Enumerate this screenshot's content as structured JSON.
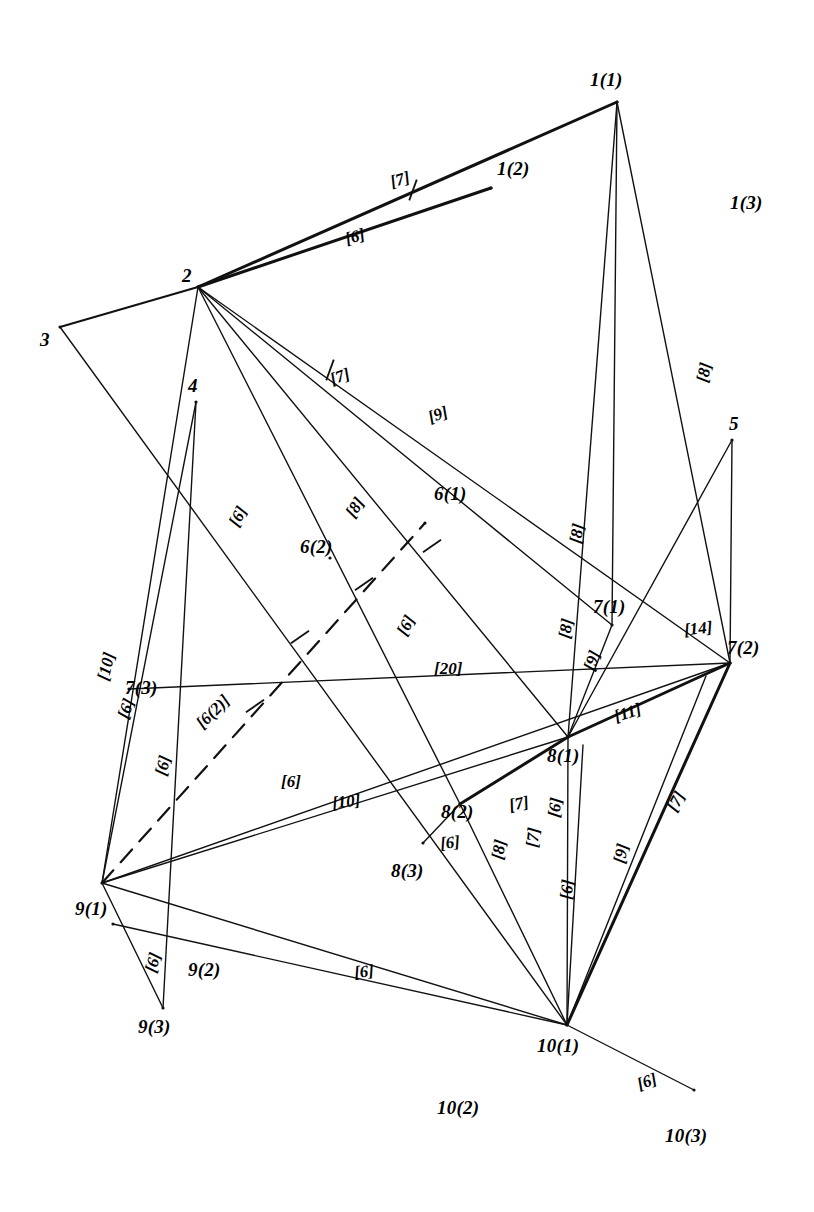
{
  "figure": {
    "type": "node-link-network-diagram",
    "background_color": "#ffffff",
    "line_color": "#111111"
  },
  "nodes": [
    {
      "id": "1(1)",
      "label": "1(1)",
      "x": 617,
      "y": 102,
      "label_x": 590,
      "label_y": 70,
      "has_vertex": true
    },
    {
      "id": "1(2)",
      "label": "1(2)",
      "x": 491,
      "y": 188,
      "label_x": 497,
      "label_y": 159,
      "has_vertex": true
    },
    {
      "id": "1(3)",
      "label": "1(3)",
      "x": 748,
      "y": 205,
      "label_x": 730,
      "label_y": 193,
      "has_vertex": false
    },
    {
      "id": "2",
      "label": "2",
      "x": 198,
      "y": 287,
      "label_x": 182,
      "label_y": 266,
      "has_vertex": true
    },
    {
      "id": "3",
      "label": "3",
      "x": 60,
      "y": 327,
      "label_x": 40,
      "label_y": 330,
      "has_vertex": true
    },
    {
      "id": "4",
      "label": "4",
      "x": 196,
      "y": 402,
      "label_x": 188,
      "label_y": 376,
      "has_vertex": true
    },
    {
      "id": "5",
      "label": "5",
      "x": 732,
      "y": 440,
      "label_x": 729,
      "label_y": 414,
      "has_vertex": true
    },
    {
      "id": "6(1)",
      "label": "6(1)",
      "x": 425,
      "y": 523,
      "label_x": 434,
      "label_y": 484,
      "has_vertex": true
    },
    {
      "id": "6(2)",
      "label": "6(2)",
      "x": 330,
      "y": 558,
      "label_x": 300,
      "label_y": 537,
      "has_vertex": true
    },
    {
      "id": "7(1)",
      "label": "7(1)",
      "x": 612,
      "y": 625,
      "label_x": 593,
      "label_y": 597,
      "has_vertex": true
    },
    {
      "id": "7(2)",
      "label": "7(2)",
      "x": 730,
      "y": 663,
      "label_x": 727,
      "label_y": 638,
      "has_vertex": true
    },
    {
      "id": "7(3)",
      "label": "7(3)",
      "x": 129,
      "y": 689,
      "label_x": 125,
      "label_y": 678,
      "has_vertex": true
    },
    {
      "id": "8(1)",
      "label": "8(1)",
      "x": 568,
      "y": 737,
      "label_x": 547,
      "label_y": 746,
      "has_vertex": true
    },
    {
      "id": "8(2)",
      "label": "8(2)",
      "x": 460,
      "y": 804,
      "label_x": 441,
      "label_y": 802,
      "has_vertex": true
    },
    {
      "id": "8(3)",
      "label": "8(3)",
      "x": 423,
      "y": 843,
      "label_x": 391,
      "label_y": 861,
      "has_vertex": true
    },
    {
      "id": "9(1)",
      "label": "9(1)",
      "x": 102,
      "y": 883,
      "label_x": 75,
      "label_y": 899,
      "has_vertex": true
    },
    {
      "id": "9(2)",
      "label": "9(2)",
      "x": 113,
      "y": 924,
      "label_x": 188,
      "label_y": 960,
      "has_vertex": true
    },
    {
      "id": "9(3)",
      "label": "9(3)",
      "x": 163,
      "y": 1008,
      "label_x": 138,
      "label_y": 1017,
      "has_vertex": true
    },
    {
      "id": "10(1)",
      "label": "10(1)",
      "x": 567,
      "y": 1025,
      "label_x": 537,
      "label_y": 1036,
      "has_vertex": true
    },
    {
      "id": "10(2)",
      "label": "10(2)",
      "x": 452,
      "y": 1106,
      "label_x": 437,
      "label_y": 1098,
      "has_vertex": false
    },
    {
      "id": "10(3)",
      "label": "10(3)",
      "x": 694,
      "y": 1090,
      "label_x": 665,
      "label_y": 1126,
      "has_vertex": true
    }
  ],
  "edges": [
    {
      "from": "2",
      "to": "1(1)",
      "weight": "[7]",
      "style": "thick"
    },
    {
      "from": "2",
      "to": "1(2)",
      "weight": "[6]",
      "style": "thick"
    },
    {
      "from": "3",
      "to": "2",
      "weight": "",
      "style": "med"
    },
    {
      "from": "1(1)",
      "to": "8(1)",
      "weight": "[8]",
      "style": "thin"
    },
    {
      "from": "1(1)",
      "to": "7(1)",
      "weight": "[8]",
      "style": "thin"
    },
    {
      "from": "1(1)",
      "to": "7(2)",
      "weight": "[8]",
      "style": "thin"
    },
    {
      "from": "2",
      "to": "7(1)",
      "weight": "[7]",
      "style": "thin"
    },
    {
      "from": "2",
      "to": "7(2)",
      "weight": "[9]",
      "style": "thin"
    },
    {
      "from": "2",
      "to": "8(1)",
      "weight": "[8]",
      "style": "thin"
    },
    {
      "from": "2",
      "to": "8(2)",
      "weight": "[6]",
      "style": "thin"
    },
    {
      "from": "2",
      "to": "9(1)",
      "weight": "[6]",
      "style": "thin"
    },
    {
      "from": "3",
      "to": "10(1)",
      "weight": "[6]",
      "style": "thin"
    },
    {
      "from": "4",
      "to": "9(1)",
      "weight": "[10]",
      "style": "thin"
    },
    {
      "from": "4",
      "to": "9(3)",
      "weight": "[6]",
      "style": "thin"
    },
    {
      "from": "5",
      "to": "7(2)",
      "weight": "[14]",
      "style": "thin"
    },
    {
      "from": "5",
      "to": "8(1)",
      "weight": "",
      "style": "thin"
    },
    {
      "from": "9(1)",
      "to": "6(1)",
      "weight": "[6]",
      "style": "dash"
    },
    {
      "from": "9(1)",
      "to": "7(2)",
      "weight": "[20]",
      "style": "thin"
    },
    {
      "from": "9(1)",
      "to": "8(1)",
      "weight": "[10]",
      "style": "thin"
    },
    {
      "from": "9(1)",
      "to": "10(1)",
      "weight": "[6]",
      "style": "thin"
    },
    {
      "from": "7(3)",
      "to": "7(2)",
      "weight": "[6]",
      "style": "thin"
    },
    {
      "from": "7(1)",
      "to": "8(1)",
      "weight": "[9]",
      "style": "thin"
    },
    {
      "from": "7(2)",
      "to": "8(1)",
      "weight": "[11]",
      "style": "thick"
    },
    {
      "from": "8(2)",
      "to": "8(1)",
      "weight": "[7]",
      "style": "thick"
    },
    {
      "from": "8(3)",
      "to": "8(2)",
      "weight": "[6]",
      "style": "thin"
    },
    {
      "from": "10(1)",
      "to": "8(2)",
      "weight": "[8]",
      "style": "thin"
    },
    {
      "from": "10(1)",
      "to": "8(1)",
      "weight": "[7]",
      "style": "thin"
    },
    {
      "from": "10(1)",
      "to": "8(1)b",
      "weight": "[6]",
      "style": "thin"
    },
    {
      "from": "10(1)",
      "to": "7(2)a",
      "weight": "[9]",
      "style": "thin"
    },
    {
      "from": "10(1)",
      "to": "7(2)",
      "weight": "[7]",
      "style": "thick"
    },
    {
      "from": "10(1)",
      "to": "10(3)",
      "weight": "[6]",
      "style": "thin"
    },
    {
      "from": "9(1)",
      "to": "9(3)",
      "weight": "[6]",
      "style": "thin"
    },
    {
      "from": "9(2)",
      "to": "10(1)",
      "weight": "[6]",
      "style": "thin"
    }
  ],
  "weight_labels": [
    {
      "text": "[7]",
      "x": 390,
      "y": 171,
      "rot": -16
    },
    {
      "text": "[6]",
      "x": 345,
      "y": 228,
      "rot": -16
    },
    {
      "text": "[8]",
      "x": 694,
      "y": 364,
      "rot": -78
    },
    {
      "text": "[8]",
      "x": 567,
      "y": 525,
      "rot": -80
    },
    {
      "text": "[8]",
      "x": 556,
      "y": 620,
      "rot": -80
    },
    {
      "text": "[7]",
      "x": 330,
      "y": 368,
      "rot": -20
    },
    {
      "text": "[9]",
      "x": 428,
      "y": 406,
      "rot": -20
    },
    {
      "text": "[8]",
      "x": 345,
      "y": 499,
      "rot": -56
    },
    {
      "text": "[6]",
      "x": 396,
      "y": 617,
      "rot": -62
    },
    {
      "text": "[6]",
      "x": 228,
      "y": 508,
      "rot": -62
    },
    {
      "text": "[10]",
      "x": 92,
      "y": 658,
      "rot": -76
    },
    {
      "text": "[6]",
      "x": 116,
      "y": 700,
      "rot": -70
    },
    {
      "text": "[6]",
      "x": 153,
      "y": 757,
      "rot": -76
    },
    {
      "text": "[6(2)]",
      "x": 193,
      "y": 703,
      "rot": -45
    },
    {
      "text": "[20]",
      "x": 434,
      "y": 660,
      "rot": 0
    },
    {
      "text": "[6]",
      "x": 281,
      "y": 773,
      "rot": 0
    },
    {
      "text": "[10]",
      "x": 332,
      "y": 793,
      "rot": -6
    },
    {
      "text": "[9]",
      "x": 582,
      "y": 652,
      "rot": -70
    },
    {
      "text": "[14]",
      "x": 684,
      "y": 620,
      "rot": -6
    },
    {
      "text": "[11]",
      "x": 614,
      "y": 704,
      "rot": -18
    },
    {
      "text": "[7]",
      "x": 509,
      "y": 795,
      "rot": -12
    },
    {
      "text": "[6]",
      "x": 545,
      "y": 799,
      "rot": -82
    },
    {
      "text": "[6]",
      "x": 440,
      "y": 834,
      "rot": -6
    },
    {
      "text": "[8]",
      "x": 489,
      "y": 841,
      "rot": -80
    },
    {
      "text": "[7]",
      "x": 523,
      "y": 829,
      "rot": -84
    },
    {
      "text": "[6]",
      "x": 557,
      "y": 881,
      "rot": -84
    },
    {
      "text": "[9]",
      "x": 611,
      "y": 845,
      "rot": -78
    },
    {
      "text": "[7]",
      "x": 666,
      "y": 793,
      "rot": -62
    },
    {
      "text": "[6]",
      "x": 143,
      "y": 954,
      "rot": -74
    },
    {
      "text": "[6]",
      "x": 354,
      "y": 963,
      "rot": -6
    },
    {
      "text": "[6]",
      "x": 637,
      "y": 1073,
      "rot": -20
    }
  ]
}
